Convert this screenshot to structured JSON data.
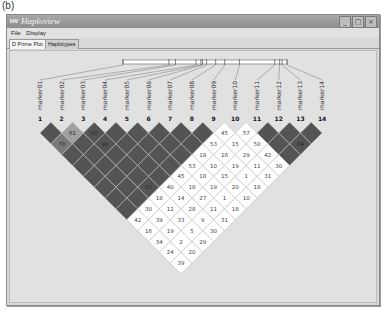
{
  "figure_label": "(b)",
  "window": {
    "title": "Haploview",
    "app_icon": "HV",
    "buttons": {
      "minimize": "_",
      "maximize": "□",
      "close": "×"
    }
  },
  "menu": {
    "items": [
      {
        "label": "File"
      },
      {
        "label": "Display"
      }
    ]
  },
  "tabs": [
    {
      "label": "D Prime Plot",
      "active": true
    },
    {
      "label": "Haplotypes",
      "active": false
    }
  ],
  "colors": {
    "strong_ld": "#545454",
    "medium_ld": "#7a7a7a",
    "light_ld": "#a0a0a0",
    "no_ld": "#ffffff",
    "background": "#e1e1e1",
    "grid_line": "#bdbdbd"
  },
  "markers": [
    {
      "num": "1",
      "name": "marker01"
    },
    {
      "num": "2",
      "name": "marker02"
    },
    {
      "num": "3",
      "name": "marker03"
    },
    {
      "num": "4",
      "name": "marker04"
    },
    {
      "num": "5",
      "name": "marker05"
    },
    {
      "num": "6",
      "name": "marker06"
    },
    {
      "num": "7",
      "name": "marker07"
    },
    {
      "num": "8",
      "name": "marker08"
    },
    {
      "num": "9",
      "name": "marker09"
    },
    {
      "num": "10",
      "name": "marker10"
    },
    {
      "num": "11",
      "name": "marker11"
    },
    {
      "num": "12",
      "name": "marker12"
    },
    {
      "num": "13",
      "name": "marker13"
    },
    {
      "num": "14",
      "name": "marker14"
    }
  ],
  "physical_positions": [
    0.0,
    0.28,
    0.32,
    0.445,
    0.475,
    0.485,
    0.51,
    0.565,
    0.62,
    0.71,
    0.925,
    0.955,
    0.97,
    1.0
  ],
  "ld_cells": [
    {
      "i": 1,
      "j": 2,
      "value": "",
      "shade": "strong"
    },
    {
      "i": 2,
      "j": 3,
      "value": "61",
      "shade": "light"
    },
    {
      "i": 3,
      "j": 4,
      "value": "92",
      "shade": "strong"
    },
    {
      "i": 4,
      "j": 5,
      "value": "",
      "shade": "strong"
    },
    {
      "i": 5,
      "j": 6,
      "value": "",
      "shade": "strong"
    },
    {
      "i": 6,
      "j": 7,
      "value": "",
      "shade": "strong"
    },
    {
      "i": 7,
      "j": 8,
      "value": "",
      "shade": "strong"
    },
    {
      "i": 8,
      "j": 9,
      "value": "",
      "shade": "strong"
    },
    {
      "i": 9,
      "j": 10,
      "value": "45",
      "shade": "none"
    },
    {
      "i": 10,
      "j": 11,
      "value": "57",
      "shade": "none"
    },
    {
      "i": 11,
      "j": 12,
      "value": "",
      "shade": "strong"
    },
    {
      "i": 12,
      "j": 13,
      "value": "",
      "shade": "strong"
    },
    {
      "i": 13,
      "j": 14,
      "value": "",
      "shade": "strong"
    },
    {
      "i": 1,
      "j": 3,
      "value": "78",
      "shade": "medium"
    },
    {
      "i": 2,
      "j": 4,
      "value": "",
      "shade": "strong"
    },
    {
      "i": 3,
      "j": 5,
      "value": "92",
      "shade": "strong"
    },
    {
      "i": 4,
      "j": 6,
      "value": "",
      "shade": "strong"
    },
    {
      "i": 5,
      "j": 7,
      "value": "",
      "shade": "strong"
    },
    {
      "i": 6,
      "j": 8,
      "value": "",
      "shade": "strong"
    },
    {
      "i": 7,
      "j": 9,
      "value": "",
      "shade": "strong"
    },
    {
      "i": 8,
      "j": 10,
      "value": "53",
      "shade": "none"
    },
    {
      "i": 9,
      "j": 11,
      "value": "15",
      "shade": "none"
    },
    {
      "i": 10,
      "j": 12,
      "value": "50",
      "shade": "none"
    },
    {
      "i": 11,
      "j": 13,
      "value": "",
      "shade": "strong"
    },
    {
      "i": 12,
      "j": 14,
      "value": "84",
      "shade": "strong"
    },
    {
      "i": 1,
      "j": 4,
      "value": "",
      "shade": "strong"
    },
    {
      "i": 2,
      "j": 5,
      "value": "",
      "shade": "strong"
    },
    {
      "i": 3,
      "j": 6,
      "value": "",
      "shade": "strong"
    },
    {
      "i": 4,
      "j": 7,
      "value": "",
      "shade": "strong"
    },
    {
      "i": 5,
      "j": 8,
      "value": "",
      "shade": "strong"
    },
    {
      "i": 6,
      "j": 9,
      "value": "",
      "shade": "strong"
    },
    {
      "i": 7,
      "j": 10,
      "value": "18",
      "shade": "none"
    },
    {
      "i": 8,
      "j": 11,
      "value": "18",
      "shade": "none"
    },
    {
      "i": 9,
      "j": 12,
      "value": "29",
      "shade": "none"
    },
    {
      "i": 10,
      "j": 13,
      "value": "42",
      "shade": "none"
    },
    {
      "i": 11,
      "j": 14,
      "value": "",
      "shade": "strong"
    },
    {
      "i": 1,
      "j": 5,
      "value": "",
      "shade": "strong"
    },
    {
      "i": 2,
      "j": 6,
      "value": "",
      "shade": "strong"
    },
    {
      "i": 3,
      "j": 7,
      "value": "",
      "shade": "strong"
    },
    {
      "i": 4,
      "j": 8,
      "value": "",
      "shade": "strong"
    },
    {
      "i": 5,
      "j": 9,
      "value": "",
      "shade": "strong"
    },
    {
      "i": 6,
      "j": 10,
      "value": "53",
      "shade": "none"
    },
    {
      "i": 7,
      "j": 11,
      "value": "10",
      "shade": "none"
    },
    {
      "i": 8,
      "j": 12,
      "value": "19",
      "shade": "none"
    },
    {
      "i": 9,
      "j": 13,
      "value": "11",
      "shade": "none"
    },
    {
      "i": 10,
      "j": 14,
      "value": "30",
      "shade": "none"
    },
    {
      "i": 1,
      "j": 6,
      "value": "",
      "shade": "strong"
    },
    {
      "i": 2,
      "j": 7,
      "value": "",
      "shade": "strong"
    },
    {
      "i": 3,
      "j": 8,
      "value": "",
      "shade": "strong"
    },
    {
      "i": 4,
      "j": 9,
      "value": "",
      "shade": "strong"
    },
    {
      "i": 5,
      "j": 10,
      "value": "45",
      "shade": "none"
    },
    {
      "i": 6,
      "j": 11,
      "value": "18",
      "shade": "none"
    },
    {
      "i": 7,
      "j": 12,
      "value": "15",
      "shade": "none"
    },
    {
      "i": 8,
      "j": 13,
      "value": "1",
      "shade": "none"
    },
    {
      "i": 9,
      "j": 14,
      "value": "31",
      "shade": "none"
    },
    {
      "i": 1,
      "j": 7,
      "value": "",
      "shade": "strong"
    },
    {
      "i": 2,
      "j": 8,
      "value": "",
      "shade": "strong"
    },
    {
      "i": 3,
      "j": 9,
      "value": "83",
      "shade": "strong"
    },
    {
      "i": 4,
      "j": 10,
      "value": "40",
      "shade": "none"
    },
    {
      "i": 5,
      "j": 11,
      "value": "18",
      "shade": "none"
    },
    {
      "i": 6,
      "j": 12,
      "value": "19",
      "shade": "none"
    },
    {
      "i": 7,
      "j": 13,
      "value": "20",
      "shade": "none"
    },
    {
      "i": 8,
      "j": 14,
      "value": "18",
      "shade": "none"
    },
    {
      "i": 1,
      "j": 8,
      "value": "",
      "shade": "strong"
    },
    {
      "i": 2,
      "j": 9,
      "value": "",
      "shade": "strong"
    },
    {
      "i": 3,
      "j": 10,
      "value": "18",
      "shade": "none"
    },
    {
      "i": 4,
      "j": 11,
      "value": "14",
      "shade": "none"
    },
    {
      "i": 5,
      "j": 12,
      "value": "27",
      "shade": "none"
    },
    {
      "i": 6,
      "j": 13,
      "value": "1",
      "shade": "none"
    },
    {
      "i": 7,
      "j": 14,
      "value": "10",
      "shade": "none"
    },
    {
      "i": 1,
      "j": 9,
      "value": "",
      "shade": "strong"
    },
    {
      "i": 2,
      "j": 10,
      "value": "30",
      "shade": "none"
    },
    {
      "i": 3,
      "j": 11,
      "value": "12",
      "shade": "none"
    },
    {
      "i": 4,
      "j": 12,
      "value": "28",
      "shade": "none"
    },
    {
      "i": 5,
      "j": 13,
      "value": "11",
      "shade": "none"
    },
    {
      "i": 6,
      "j": 14,
      "value": "18",
      "shade": "none"
    },
    {
      "i": 1,
      "j": 10,
      "value": "42",
      "shade": "none"
    },
    {
      "i": 2,
      "j": 11,
      "value": "39",
      "shade": "none"
    },
    {
      "i": 3,
      "j": 12,
      "value": "33",
      "shade": "none"
    },
    {
      "i": 4,
      "j": 13,
      "value": "9",
      "shade": "none"
    },
    {
      "i": 5,
      "j": 14,
      "value": "31",
      "shade": "none"
    },
    {
      "i": 1,
      "j": 11,
      "value": "16",
      "shade": "none"
    },
    {
      "i": 2,
      "j": 12,
      "value": "19",
      "shade": "none"
    },
    {
      "i": 3,
      "j": 13,
      "value": "5",
      "shade": "none"
    },
    {
      "i": 4,
      "j": 14,
      "value": "30",
      "shade": "none"
    },
    {
      "i": 1,
      "j": 12,
      "value": "34",
      "shade": "none"
    },
    {
      "i": 2,
      "j": 13,
      "value": "2",
      "shade": "none"
    },
    {
      "i": 3,
      "j": 14,
      "value": "29",
      "shade": "none"
    },
    {
      "i": 1,
      "j": 13,
      "value": "24",
      "shade": "none"
    },
    {
      "i": 2,
      "j": 14,
      "value": "20",
      "shade": "none"
    },
    {
      "i": 1,
      "j": 14,
      "value": "39",
      "shade": "none"
    }
  ]
}
